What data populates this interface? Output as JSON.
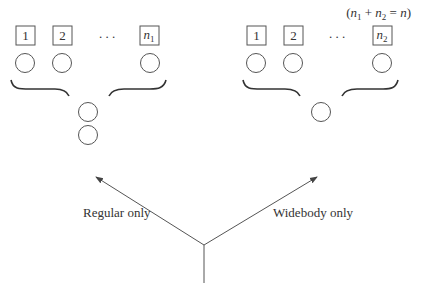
{
  "diagram": {
    "type": "decision-tree",
    "left_group": {
      "boxes": [
        {
          "label": "1",
          "sub": ""
        },
        {
          "label": "2",
          "sub": ""
        },
        {
          "label": "n",
          "sub": "1"
        }
      ],
      "ellipsis": ". . .",
      "merged_circles": 2
    },
    "right_group": {
      "boxes": [
        {
          "label": "1",
          "sub": ""
        },
        {
          "label": "2",
          "sub": ""
        },
        {
          "label": "n",
          "sub": "2"
        }
      ],
      "ellipsis": ". . .",
      "merged_circles": 1,
      "note": {
        "open": "(",
        "n1": "n",
        "n1_sub": "1",
        "plus": " + ",
        "n2": "n",
        "n2_sub": "2",
        "eq": " = ",
        "n": "n",
        "close": ")"
      }
    },
    "branches": {
      "left_label": "Regular only",
      "right_label": "Widebody only"
    },
    "colors": {
      "stroke": "#555555",
      "text": "#333333"
    }
  }
}
